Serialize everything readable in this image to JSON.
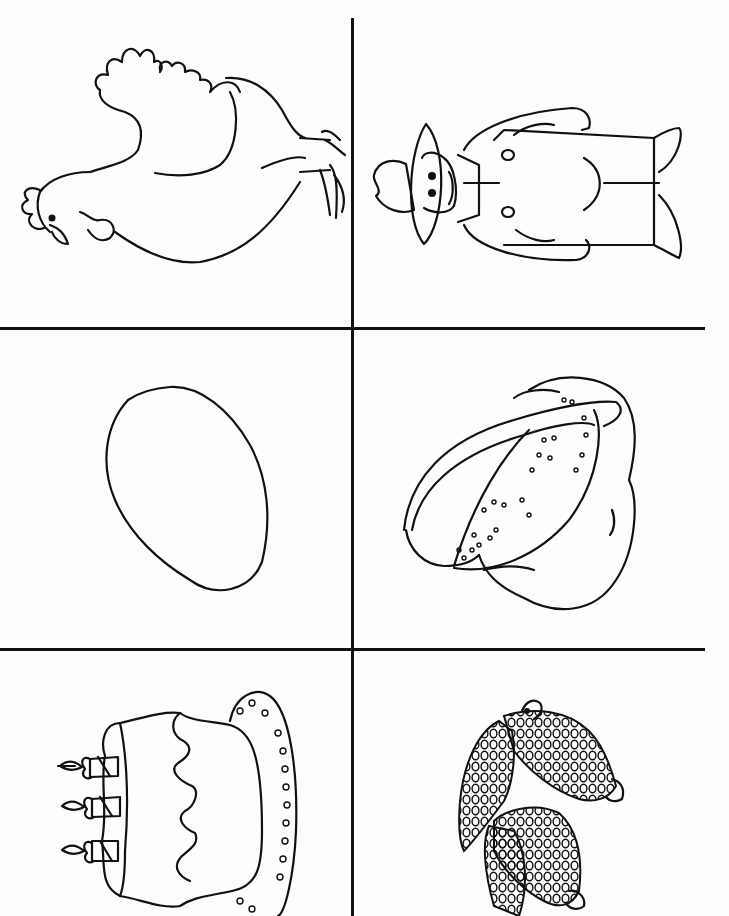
{
  "worksheet": {
    "layout": {
      "columns": 2,
      "rows": 3,
      "orientation": "rotated-90"
    },
    "line_color": "#111111",
    "background_color": "#ffffff",
    "cells": [
      {
        "position": "row1-left",
        "picture": "hen"
      },
      {
        "position": "row1-right",
        "picture": "farmer"
      },
      {
        "position": "row2-left",
        "picture": "egg"
      },
      {
        "position": "row2-right",
        "picture": "bread"
      },
      {
        "position": "row3-left",
        "picture": "birthday-cake"
      },
      {
        "position": "row3-right",
        "picture": "corn"
      }
    ]
  }
}
